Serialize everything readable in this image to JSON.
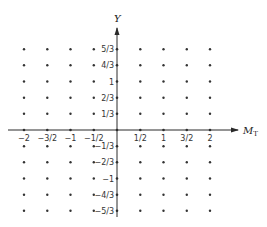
{
  "diagram": {
    "type": "lattice-weight-diagram",
    "colors": {
      "ink": "#2a2a2a",
      "dot": "#333333",
      "background": "#ffffff"
    },
    "axes": {
      "x": {
        "label": "M",
        "label_subscript": "T",
        "arrow": "right"
      },
      "y": {
        "label": "Y",
        "arrow": "up"
      }
    },
    "x_ticks": [
      {
        "value": -2,
        "label": "−2"
      },
      {
        "value": -1.5,
        "label": "−3/2"
      },
      {
        "value": -1,
        "label": "−1"
      },
      {
        "value": -0.5,
        "label": "−1/2"
      },
      {
        "value": 0.5,
        "label": "1/2"
      },
      {
        "value": 1,
        "label": "1"
      },
      {
        "value": 1.5,
        "label": "3/2"
      },
      {
        "value": 2,
        "label": "2"
      }
    ],
    "y_ticks": [
      {
        "value": 1.6667,
        "label": "5/3"
      },
      {
        "value": 1.3333,
        "label": "4/3"
      },
      {
        "value": 1,
        "label": "1"
      },
      {
        "value": 0.6667,
        "label": "2/3"
      },
      {
        "value": 0.3333,
        "label": "1/3"
      },
      {
        "value": -0.3333,
        "label": "−1/3"
      },
      {
        "value": -0.6667,
        "label": "−2/3"
      },
      {
        "value": -1,
        "label": "−1"
      },
      {
        "value": -1.3333,
        "label": "−4/3"
      },
      {
        "value": -1.6667,
        "label": "−5/3"
      }
    ],
    "lattice": {
      "x_values": [
        -2,
        -1.5,
        -1,
        -0.5,
        0,
        0.5,
        1,
        1.5,
        2
      ],
      "y_values": [
        1.6667,
        1.3333,
        1,
        0.6667,
        0.3333,
        0,
        -0.3333,
        -0.6667,
        -1,
        -1.3333,
        -1.6667
      ]
    }
  }
}
